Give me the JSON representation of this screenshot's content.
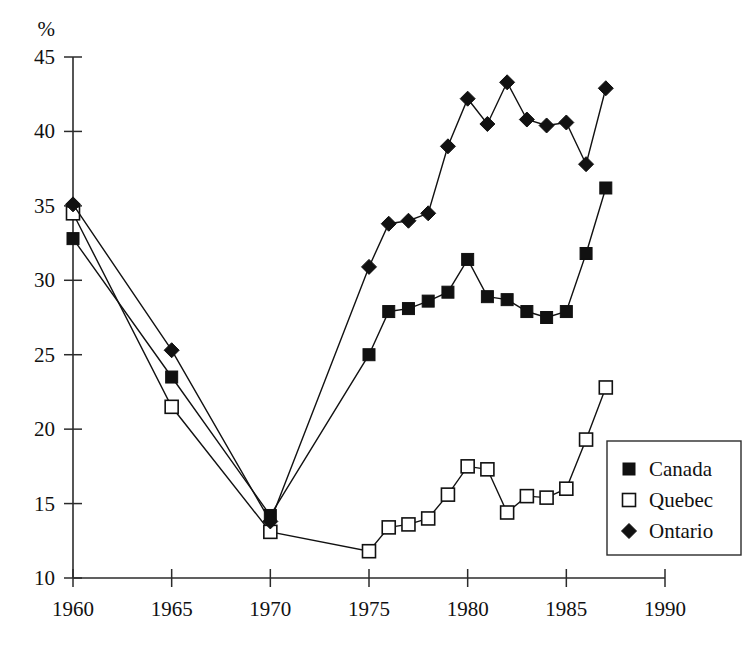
{
  "chart_data": {
    "type": "line",
    "title": "",
    "subtitle": "",
    "xlabel": "",
    "ylabel": "%",
    "axis_unit_label": "%",
    "xlim": [
      1960,
      1990
    ],
    "ylim": [
      10,
      45
    ],
    "xticks": [
      1960,
      1965,
      1970,
      1975,
      1980,
      1985,
      1990
    ],
    "xtick_labels": [
      "1960",
      "1965",
      "1970",
      "1975",
      "1980",
      "1985",
      "1990"
    ],
    "yticks": [
      10,
      15,
      20,
      25,
      30,
      35,
      40,
      45
    ],
    "ytick_labels": [
      "10",
      "15",
      "20",
      "25",
      "30",
      "35",
      "40",
      "45"
    ],
    "grid": false,
    "legend_position": "bottom-right",
    "series": [
      {
        "name": "Canada",
        "marker": "filled-square",
        "color": "#111111",
        "x": [
          1960,
          1965,
          1970,
          1975,
          1976,
          1977,
          1978,
          1979,
          1980,
          1981,
          1982,
          1983,
          1984,
          1985,
          1986,
          1987
        ],
        "values": [
          32.8,
          23.5,
          14.2,
          25.0,
          27.9,
          28.1,
          28.6,
          29.2,
          31.4,
          28.9,
          28.7,
          27.9,
          27.5,
          27.9,
          31.8,
          36.2
        ]
      },
      {
        "name": "Quebec",
        "marker": "open-square",
        "color": "#111111",
        "x": [
          1960,
          1965,
          1970,
          1975,
          1976,
          1977,
          1978,
          1979,
          1980,
          1981,
          1982,
          1983,
          1984,
          1985,
          1986,
          1987
        ],
        "values": [
          34.5,
          21.5,
          13.1,
          11.8,
          13.4,
          13.6,
          14.0,
          15.6,
          17.5,
          17.3,
          14.4,
          15.5,
          15.4,
          16.0,
          19.3,
          22.8
        ]
      },
      {
        "name": "Ontario",
        "marker": "filled-diamond",
        "color": "#111111",
        "x": [
          1960,
          1965,
          1970,
          1975,
          1976,
          1977,
          1978,
          1979,
          1980,
          1981,
          1982,
          1983,
          1984,
          1985,
          1986,
          1987
        ],
        "values": [
          35.1,
          25.3,
          13.8,
          30.9,
          33.8,
          34.0,
          34.5,
          39.0,
          42.2,
          40.5,
          43.3,
          40.8,
          40.4,
          40.6,
          37.8,
          42.9
        ]
      }
    ]
  },
  "legend": {
    "entries": [
      {
        "label": "Canada",
        "marker": "filled-square"
      },
      {
        "label": "Quebec",
        "marker": "open-square"
      },
      {
        "label": "Ontario",
        "marker": "filled-diamond"
      }
    ]
  }
}
